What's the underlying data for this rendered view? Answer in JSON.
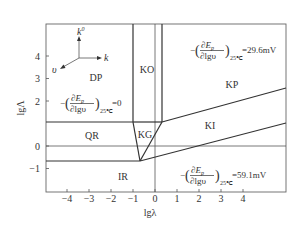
{
  "chart_data": {
    "type": "diagram",
    "title": "",
    "xlabel": "lgλ",
    "ylabel": "lgΛ",
    "xlim": [
      -5,
      6
    ],
    "ylim": [
      -1.9,
      5.4
    ],
    "x_ticks": [
      "-4",
      "-3",
      "-2",
      "-1",
      "0",
      "1",
      "2",
      "3",
      "4"
    ],
    "y_ticks": [
      "4",
      "3",
      "2",
      "0",
      "-1"
    ],
    "regions": [
      {
        "label": "DP"
      },
      {
        "label": "KO"
      },
      {
        "label": "KP"
      },
      {
        "label": "QR"
      },
      {
        "label": "KG"
      },
      {
        "label": "KI"
      },
      {
        "label": "IR"
      }
    ],
    "boundaries": {
      "horizontal_upper_lgLambda": 1.05,
      "horizontal_lower_lgLambda": -0.62,
      "reference_lgLambda": 0,
      "ko_left_lglambda": -1,
      "ko_right_lglambda": 0.3,
      "reference_lglambda": 0,
      "kg_apex": {
        "lglambda": -0.7,
        "lgLambda": -0.62
      },
      "kp_ki_line": [
        {
          "lglambda": 0.3,
          "lgLambda": 1.05
        },
        {
          "lglambda": 6,
          "lgLambda": 2.55
        }
      ],
      "ki_ir_line": [
        {
          "lglambda": -0.7,
          "lgLambda": -0.62
        },
        {
          "lglambda": 6,
          "lgLambda": 1.0
        }
      ]
    },
    "annotations": {
      "dp_equation": {
        "prefix": "−",
        "numerator": "∂E",
        "num_sub": "p",
        "denominator": "∂lgυ",
        "subscript": "25℃",
        "value": "=0"
      },
      "kp_equation": {
        "prefix": "−",
        "numerator": "∂E",
        "num_sub": "p",
        "denominator": "∂lgυ",
        "subscript": "25℃",
        "value": "=29.6mV"
      },
      "ir_equation": {
        "prefix": "−",
        "numerator": "∂E",
        "num_sub": "p",
        "denominator": "∂lgυ",
        "subscript": "25℃",
        "value": "=59.1mV"
      }
    },
    "axes_inset": {
      "up_label": "k",
      "up_sup": "0",
      "right_label": "k",
      "diag_label": "υ"
    }
  }
}
